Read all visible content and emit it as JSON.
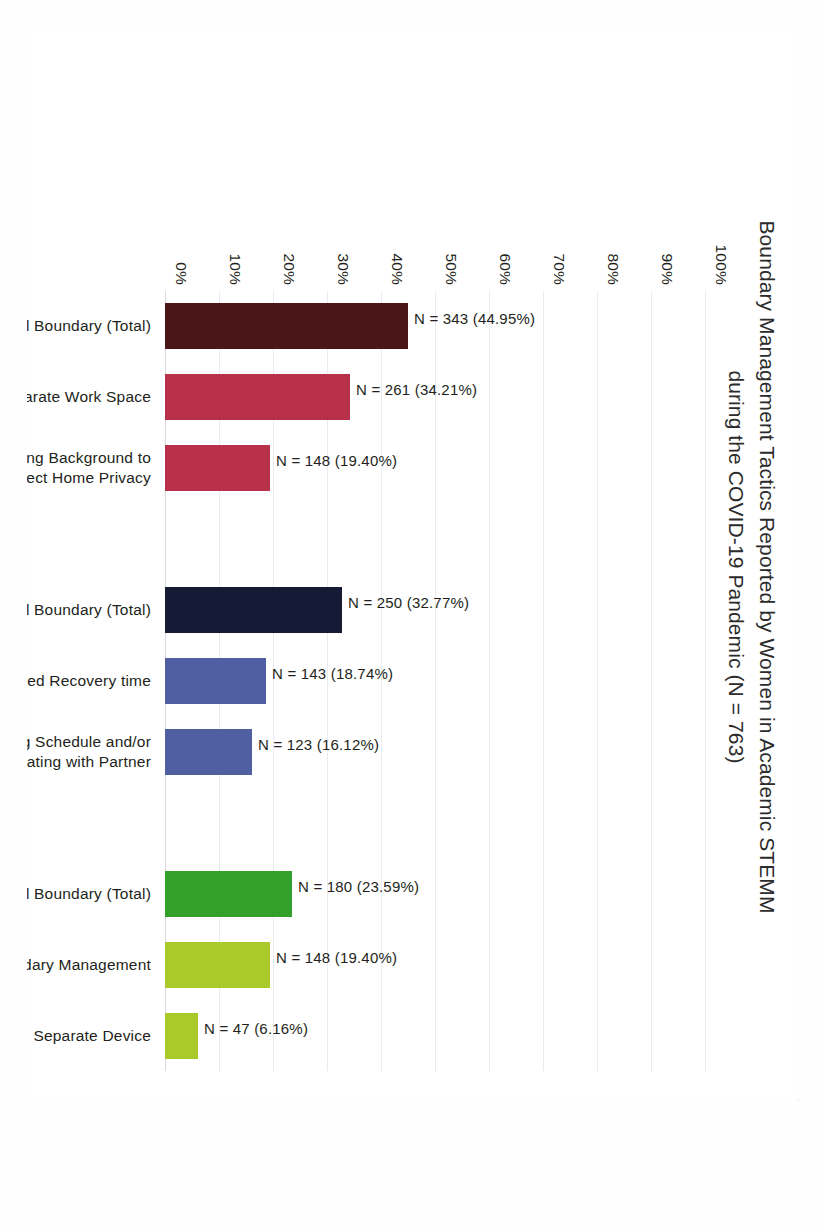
{
  "chart_data": {
    "type": "bar",
    "title": "Boundary Management Tactics Reported by Women in Academic STEMM during the COVID-19 Pandemic (N = 763)",
    "title_lines": [
      "Boundary Management Tactics Reported by Women in Academic STEMM",
      "during the COVID-19 Pandemic (N = 763)"
    ],
    "total_n": 763,
    "xlabel": "",
    "ylabel": "",
    "ylim": [
      0,
      100
    ],
    "ytick_labels": [
      "0%",
      "10%",
      "20%",
      "30%",
      "40%",
      "50%",
      "60%",
      "70%",
      "80%",
      "90%",
      "100%"
    ],
    "ytick_values": [
      0,
      10,
      20,
      30,
      40,
      50,
      60,
      70,
      80,
      90,
      100
    ],
    "grid": true,
    "legend": "none",
    "orientation": "vertical-bars-rotated-page",
    "categories": [
      "Spatial Boundary (Total)",
      "Separate Work Space",
      "Video Meeting Background to Protect Home Privacy",
      "",
      "Temporal Boundary (Total)",
      "Self-imposed  Recovery time",
      "Creating Schedule and/or Coordinating with Partner",
      "",
      "Technological Boundary (Total)",
      "Email Boundary Management",
      "Separate Device"
    ],
    "values": [
      44.95,
      34.21,
      19.4,
      null,
      32.77,
      18.74,
      16.12,
      null,
      23.59,
      19.4,
      6.16
    ],
    "counts": [
      343,
      261,
      148,
      null,
      250,
      143,
      123,
      null,
      180,
      148,
      47
    ],
    "bar_labels": [
      "N = 343 (44.95%)",
      "N = 261 (34.21%)",
      "N = 148 (19.40%)",
      "",
      "N = 250 (32.77%)",
      "N = 143 (18.74%)",
      "N = 123 (16.12%)",
      "",
      "N = 180 (23.59%)",
      "N = 148 (19.40%)",
      "N = 47 (6.16%)"
    ],
    "bar_colors": [
      "#4a1618",
      "#b8304a",
      "#b8304a",
      "",
      "#161b35",
      "#505fa2",
      "#505fa2",
      "",
      "#34a02c",
      "#aac92a",
      "#aac92a"
    ],
    "category_label_lines": [
      [
        "Spatial Boundary (Total)"
      ],
      [
        "Separate Work Space"
      ],
      [
        "Video Meeting Background to",
        "Protect Home Privacy"
      ],
      [
        ""
      ],
      [
        "Temporal Boundary (Total)"
      ],
      [
        "Self-imposed  Recovery time"
      ],
      [
        "Creating Schedule and/or",
        "Coordinating with Partner"
      ],
      [
        ""
      ],
      [
        "Technological Boundary (Total)"
      ],
      [
        "Email Boundary Management"
      ],
      [
        "Separate Device"
      ]
    ],
    "groups": [
      {
        "name": "Spatial Boundary",
        "total_count": 343,
        "total_percent": 44.95
      },
      {
        "name": "Temporal Boundary",
        "total_count": 250,
        "total_percent": 32.77
      },
      {
        "name": "Technological Boundary",
        "total_count": 180,
        "total_percent": 23.59
      }
    ]
  },
  "colors": {
    "gridline": "#e9ebee",
    "axis": "#d7dadd",
    "text": "#231f20",
    "page_background": "#ffffff",
    "frame_border": "#eceef1"
  }
}
